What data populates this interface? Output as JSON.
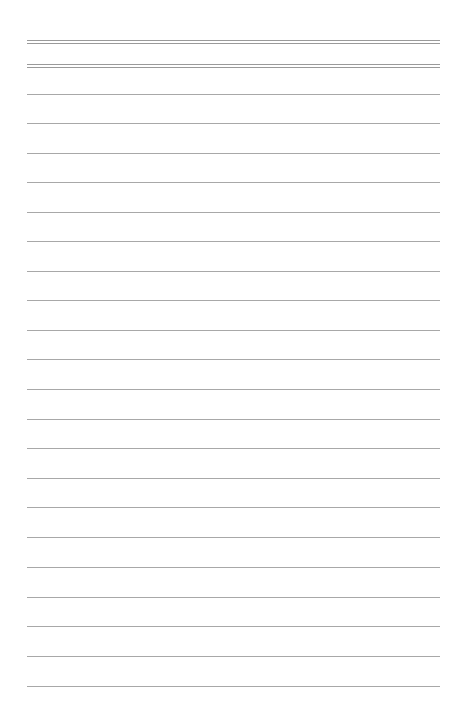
{
  "page": {
    "type": "blank ruled paper",
    "background": "#ffffff",
    "rule_color": "#a8a8a8",
    "margin_left": 27,
    "margin_right": 20,
    "header_double_rules_y": [
      40,
      64
    ],
    "ruled_lines_y": [
      94,
      123,
      153,
      182,
      212,
      241,
      271,
      300,
      330,
      359,
      389,
      419,
      448,
      478,
      507,
      537,
      567,
      597,
      626,
      656,
      686
    ],
    "text": ""
  }
}
